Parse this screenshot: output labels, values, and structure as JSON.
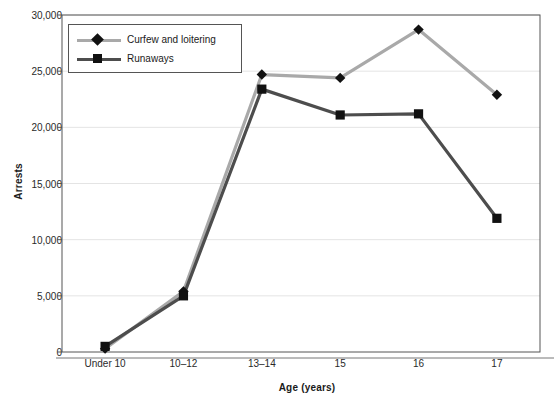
{
  "chart_data": {
    "type": "line",
    "title": "",
    "xlabel": "Age (years)",
    "ylabel": "Arrests",
    "categories": [
      "Under 10",
      "10–12",
      "13–14",
      "15",
      "16",
      "17"
    ],
    "ylim": [
      0,
      30000
    ],
    "ytick_labels": [
      "0",
      "5,000",
      "10,000",
      "15,000",
      "20,000",
      "25,000",
      "30,000"
    ],
    "ytick_values": [
      0,
      5000,
      10000,
      15000,
      20000,
      25000,
      30000
    ],
    "grid": "horizontal",
    "legend_position": "top-left",
    "series": [
      {
        "name": "Curfew and loitering",
        "color": "#a9a9a9",
        "marker": "diamond",
        "values": [
          300,
          5400,
          24700,
          24400,
          28700,
          22900
        ]
      },
      {
        "name": "Runaways",
        "color": "#4d4d4d",
        "marker": "square",
        "values": [
          500,
          5000,
          23400,
          21100,
          21200,
          11900
        ]
      }
    ]
  },
  "legend": {
    "items": [
      {
        "label": "Curfew and loitering"
      },
      {
        "label": "Runaways"
      }
    ]
  },
  "colors": {
    "series_1": "#a9a9a9",
    "series_2": "#4d4d4d",
    "marker": "#111111",
    "axis": "#555555",
    "grid": "#e4e4e4",
    "text": "#1a1a1a"
  }
}
